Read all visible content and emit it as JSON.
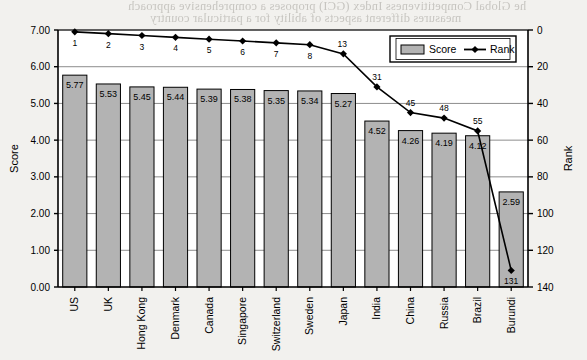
{
  "background_texts": [
    {
      "text": "he Global Competitiveness Index (GCI) proposes a comprehensive approach",
      "x": 128,
      "y": 2
    },
    {
      "text": "measures different aspects of ability for a particular country",
      "x": 150,
      "y": 14
    }
  ],
  "chart_data": {
    "type": "bar",
    "title": "",
    "xlabel": "",
    "ylabel": "Score",
    "y2label": "Rank",
    "ylim": [
      0,
      7
    ],
    "y2lim": [
      0,
      140
    ],
    "yticks": [
      "0.00",
      "1.00",
      "2.00",
      "3.00",
      "4.00",
      "5.00",
      "6.00",
      "7.00"
    ],
    "y2ticks": [
      "0",
      "20",
      "40",
      "60",
      "80",
      "100",
      "120",
      "140"
    ],
    "grid": true,
    "legend_position": "top-right",
    "categories": [
      "US",
      "UK",
      "Hong Kong",
      "Denmark",
      "Canada",
      "Singapore",
      "Switzerland",
      "Sweden",
      "Japan",
      "India",
      "China",
      "Russia",
      "Brazil",
      "Burundi"
    ],
    "series": [
      {
        "name": "Score",
        "type": "bar",
        "values": [
          5.77,
          5.53,
          5.45,
          5.44,
          5.39,
          5.38,
          5.35,
          5.34,
          5.27,
          4.52,
          4.26,
          4.19,
          4.12,
          2.59
        ],
        "labels": [
          "5.77",
          "5.53",
          "5.45",
          "5.44",
          "5.39",
          "5.38",
          "5.35",
          "5.34",
          "5.27",
          "4.52",
          "4.26",
          "4.19",
          "4.12",
          "2.59"
        ],
        "color": "#b3b3b3",
        "edge_color": "#000000"
      },
      {
        "name": "Rank",
        "type": "line",
        "values": [
          1,
          2,
          3,
          4,
          5,
          6,
          7,
          8,
          13,
          31,
          45,
          48,
          55,
          131
        ],
        "labels": [
          "1",
          "2",
          "3",
          "4",
          "5",
          "6",
          "7",
          "8",
          "13",
          "31",
          "45",
          "48",
          "55",
          "131"
        ],
        "color": "#000000",
        "marker": "diamond"
      }
    ]
  },
  "legend": {
    "items": [
      {
        "label": "Score",
        "kind": "bar-swatch"
      },
      {
        "label": "Rank",
        "kind": "line-marker"
      }
    ]
  }
}
